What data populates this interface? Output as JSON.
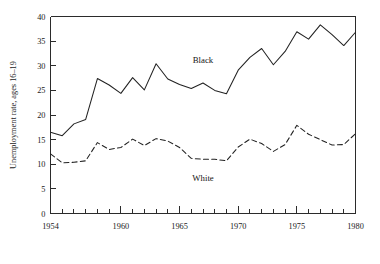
{
  "chart_data": {
    "type": "line",
    "title": "",
    "xlabel": "",
    "ylabel": "Unemployment rate, ages 16–19",
    "xlim": [
      1954,
      1980
    ],
    "ylim": [
      0,
      40
    ],
    "grid": false,
    "legend_position": "inline-annotations",
    "y_ticks": [
      0,
      5,
      10,
      15,
      20,
      25,
      30,
      35,
      40
    ],
    "y_tick_labels": [
      "0",
      "5",
      "10",
      "15",
      "20",
      "25",
      "30",
      "35",
      "40"
    ],
    "x_ticks": [
      1954,
      1955,
      1956,
      1957,
      1958,
      1959,
      1960,
      1961,
      1962,
      1963,
      1964,
      1965,
      1966,
      1967,
      1968,
      1969,
      1970,
      1971,
      1972,
      1973,
      1974,
      1975,
      1976,
      1977,
      1978,
      1979,
      1980
    ],
    "x_major_ticks": [
      1954,
      1960,
      1965,
      1970,
      1975,
      1980
    ],
    "x_tick_labels": [
      "1954",
      "1960",
      "1965",
      "1970",
      "1975",
      "1980"
    ],
    "x": [
      1954,
      1955,
      1956,
      1957,
      1958,
      1959,
      1960,
      1961,
      1962,
      1963,
      1964,
      1965,
      1966,
      1967,
      1968,
      1969,
      1970,
      1971,
      1972,
      1973,
      1974,
      1975,
      1976,
      1977,
      1978,
      1979,
      1980
    ],
    "series": [
      {
        "name": "Black",
        "style": "solid",
        "color": "#222222",
        "label_x": 1967,
        "label_y": 30.5,
        "values": [
          16.5,
          15.8,
          18.2,
          19.1,
          27.4,
          26.1,
          24.4,
          27.6,
          25.1,
          30.4,
          27.3,
          26.2,
          25.4,
          26.5,
          25.0,
          24.3,
          29.1,
          31.7,
          33.5,
          30.2,
          32.9,
          36.9,
          35.4,
          38.3,
          36.3,
          34.1,
          36.8
        ]
      },
      {
        "name": "White",
        "style": "dashed",
        "color": "#222222",
        "label_x": 1967,
        "label_y": 6.5,
        "values": [
          12.1,
          10.3,
          10.4,
          10.7,
          14.4,
          13.0,
          13.4,
          15.1,
          13.8,
          15.2,
          14.7,
          13.4,
          11.2,
          11.0,
          11.0,
          10.7,
          13.5,
          15.1,
          14.2,
          12.6,
          14.0,
          17.9,
          16.1,
          15.0,
          13.9,
          14.0,
          16.2
        ]
      }
    ]
  },
  "annotations": {
    "black_label": "Black",
    "white_label": "White"
  },
  "axes": {
    "y_axis_title": "Unemployment rate, ages 16–19"
  }
}
